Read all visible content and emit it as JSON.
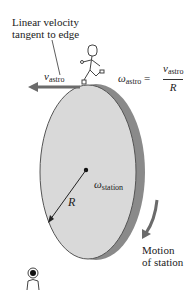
{
  "labels": {
    "linear_velocity_line1": "Linear velocity",
    "linear_velocity_line2": "tangent to edge",
    "v_symbol": "v",
    "astro_sub": "astro",
    "omega_symbol": "ω",
    "equals": "=",
    "R": "R",
    "station_sub": "station",
    "motion_line1": "Motion",
    "motion_line2": "of station"
  },
  "equation": {
    "lhs_symbol": "ω",
    "lhs_sub": "astro",
    "numerator_symbol": "v",
    "numerator_sub": "astro",
    "denominator": "R"
  },
  "colors": {
    "disk_face": "#d9d9d9",
    "disk_edge": "#8a8a8a",
    "arrow": "#6b6b6b"
  }
}
